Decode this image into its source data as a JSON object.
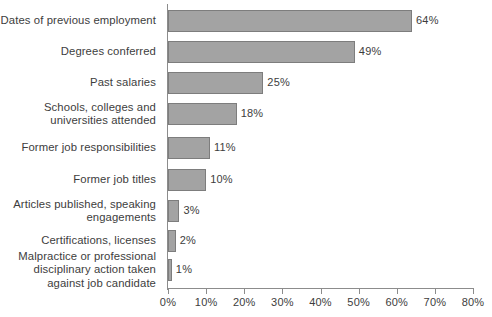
{
  "chart_data": {
    "type": "bar",
    "orientation": "horizontal",
    "title": "",
    "xlabel": "",
    "ylabel": "",
    "xlim": [
      0,
      80
    ],
    "grid": false,
    "legend": null,
    "tick_suffix": "%",
    "xticks": [
      {
        "value": 0,
        "label": "0%"
      },
      {
        "value": 10,
        "label": "10%"
      },
      {
        "value": 20,
        "label": "20%"
      },
      {
        "value": 30,
        "label": "30%"
      },
      {
        "value": 40,
        "label": "40%"
      },
      {
        "value": 50,
        "label": "50%"
      },
      {
        "value": 60,
        "label": "60%"
      },
      {
        "value": 70,
        "label": "70%"
      },
      {
        "value": 80,
        "label": "80%"
      }
    ],
    "categories": [
      "Dates of previous employment",
      "Degrees conferred",
      "Past salaries",
      "Schools, colleges and universities attended",
      "Former job responsibilities",
      "Former job titles",
      "Articles published, speaking engagements",
      "Certifications, licenses",
      "Malpractice or professional disciplinary action taken against job candidate"
    ],
    "values": [
      64,
      49,
      25,
      18,
      11,
      10,
      3,
      2,
      1
    ],
    "data_labels": [
      "64%",
      "49%",
      "25%",
      "18%",
      "11%",
      "10%",
      "3%",
      "2%",
      "1%"
    ],
    "colors": {
      "bar_fill": "#a3a3a3",
      "bar_stroke": "#7d7d7d",
      "axis": "#8c8c8c",
      "text": "#3d3d3d",
      "background": "#ffffff"
    }
  },
  "rows": [
    {
      "label_lines": [
        "Dates of previous employment"
      ],
      "value": 64,
      "data_label": "64%",
      "top": 10,
      "height": 22
    },
    {
      "label_lines": [
        "Degrees conferred"
      ],
      "value": 49,
      "data_label": "49%",
      "top": 41,
      "height": 22
    },
    {
      "label_lines": [
        "Past salaries"
      ],
      "value": 25,
      "data_label": "25%",
      "top": 72,
      "height": 22
    },
    {
      "label_lines": [
        "Schools, colleges and",
        "universities attended"
      ],
      "value": 18,
      "data_label": "18%",
      "top": 103,
      "height": 22
    },
    {
      "label_lines": [
        "Former job responsibilities"
      ],
      "value": 11,
      "data_label": "11%",
      "top": 137,
      "height": 22
    },
    {
      "label_lines": [
        "Former job titles"
      ],
      "value": 10,
      "data_label": "10%",
      "top": 169,
      "height": 22
    },
    {
      "label_lines": [
        "Articles published, speaking",
        "engagements"
      ],
      "value": 3,
      "data_label": "3%",
      "top": 200,
      "height": 22
    },
    {
      "label_lines": [
        "Certifications, licenses"
      ],
      "value": 2,
      "data_label": "2%",
      "top": 230,
      "height": 22
    },
    {
      "label_lines": [
        "Malpractice or professional",
        "disciplinary action taken",
        "against job candidate"
      ],
      "value": 1,
      "data_label": "1%",
      "top": 259,
      "height": 22
    }
  ]
}
